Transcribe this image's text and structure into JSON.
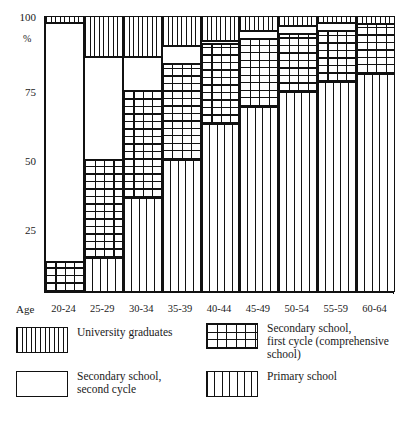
{
  "chart_data": {
    "type": "bar",
    "subtype": "stacked-100-percent",
    "title": "",
    "xlabel": "Age",
    "ylabel": "%",
    "ylim": [
      0,
      100
    ],
    "yticks": [
      0,
      25,
      50,
      75,
      100
    ],
    "ytick_labels": [
      "",
      "25",
      "50",
      "75",
      "100"
    ],
    "grid": false,
    "legend_position": "below",
    "categories": [
      "20-24",
      "25-29",
      "30-34",
      "35-39",
      "40-44",
      "45-49",
      "50-54",
      "55-59",
      "60-64"
    ],
    "series": [
      {
        "name": "University graduates",
        "pattern": "vertical-fine-hatch",
        "values": [
          2.5,
          15.0,
          15.0,
          11.0,
          9.0,
          5.5,
          3.5,
          2.5,
          3.0
        ]
      },
      {
        "name": "Secondary school, second cycle",
        "pattern": "blank-white",
        "values": [
          86.5,
          37.0,
          12.0,
          6.5,
          1.0,
          3.0,
          3.0,
          3.0,
          0.0
        ]
      },
      {
        "name": "Secondary school, first cycle (comprehensive school)",
        "pattern": "cross-hatch-grid",
        "values": [
          11.0,
          35.5,
          39.0,
          34.5,
          29.0,
          24.5,
          21.0,
          18.5,
          18.0
        ]
      },
      {
        "name": "Primary school",
        "pattern": "vertical-wide-hatch",
        "values": [
          0.0,
          12.5,
          34.0,
          48.0,
          61.0,
          67.0,
          72.5,
          76.0,
          79.0
        ]
      }
    ]
  },
  "axis": {
    "y_unit": "%",
    "ticks": [
      {
        "label": "100",
        "value": 100
      },
      {
        "label": "75",
        "value": 75
      },
      {
        "label": "50",
        "value": 50
      },
      {
        "label": "25",
        "value": 25
      }
    ],
    "x_axis_caption": "Age",
    "x_categories": [
      "20-24",
      "25-29",
      "30-34",
      "35-39",
      "40-44",
      "45-49",
      "50-54",
      "55-59",
      "60-64"
    ]
  },
  "legend": {
    "items": [
      {
        "key": "university",
        "pattern": "vertical-fine-hatch",
        "line1": "University graduates",
        "line2": "",
        "line3": ""
      },
      {
        "key": "secondary_second",
        "pattern": "blank-white",
        "line1": "Secondary school,",
        "line2": "second cycle",
        "line3": ""
      },
      {
        "key": "secondary_first",
        "pattern": "cross-hatch-grid",
        "line1": "Secondary school,",
        "line2": "first cycle (comprehensive",
        "line3": "school)"
      },
      {
        "key": "primary",
        "pattern": "vertical-wide-hatch",
        "line1": "Primary school",
        "line2": "",
        "line3": ""
      }
    ]
  },
  "colors": {
    "ink": "#111111",
    "background": "#ffffff"
  }
}
